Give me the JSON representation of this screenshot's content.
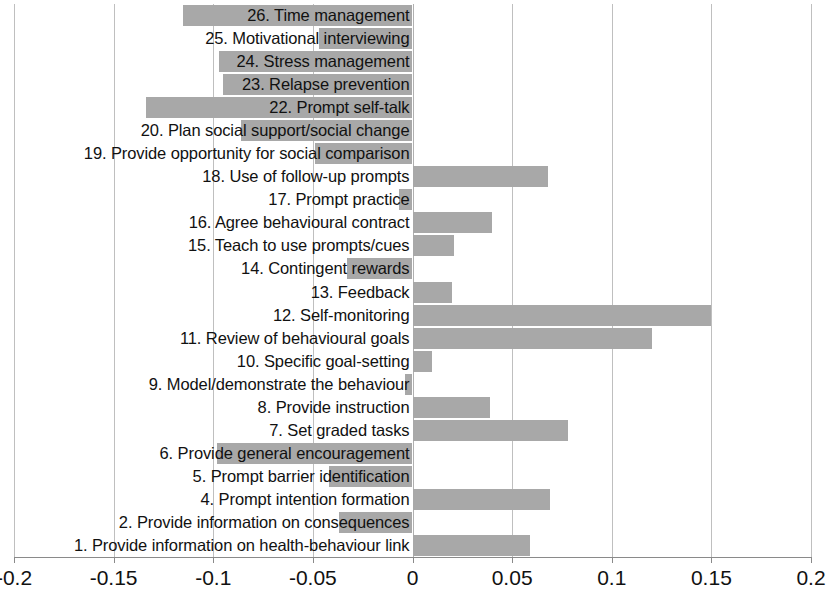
{
  "chart_data": {
    "type": "bar",
    "orientation": "horizontal",
    "title": "",
    "xlabel": "",
    "ylabel": "",
    "xlim": [
      -0.2,
      0.2
    ],
    "xticks": [
      -0.2,
      -0.15,
      -0.1,
      -0.05,
      0,
      0.05,
      0.1,
      0.15,
      0.2
    ],
    "xticklabels": [
      "-0.2",
      "-0.15",
      "-0.1",
      "-0.05",
      "0",
      "0.05",
      "0.1",
      "0.15",
      "0.2"
    ],
    "grid": true,
    "legend": false,
    "bar_color": "#a8a8a8",
    "categories": [
      "26. Time management",
      "25. Motivational interviewing",
      "24. Stress management",
      "23. Relapse prevention",
      "22. Prompt self-talk",
      "20. Plan social support/social change",
      "19. Provide opportunity for social comparison",
      "18. Use of follow-up prompts",
      "17. Prompt practice",
      "16. Agree behavioural contract",
      "15. Teach to use prompts/cues",
      "14. Contingent rewards",
      "13. Feedback",
      "12. Self-monitoring",
      "11. Review of behavioural goals",
      "10. Specific goal-setting",
      "9. Model/demonstrate the behaviour",
      "8. Provide instruction",
      "7. Set graded tasks",
      "6. Provide general encouragement",
      "5. Prompt barrier identification",
      "4. Prompt intention formation",
      "2. Provide information on consequences",
      "1. Provide information on health-behaviour link"
    ],
    "values": [
      -0.115,
      -0.047,
      -0.097,
      -0.095,
      -0.134,
      -0.086,
      -0.049,
      0.068,
      -0.007,
      0.04,
      0.021,
      -0.033,
      0.02,
      0.15,
      0.12,
      0.01,
      -0.004,
      0.039,
      0.078,
      -0.098,
      -0.042,
      0.069,
      -0.037,
      0.059
    ]
  }
}
